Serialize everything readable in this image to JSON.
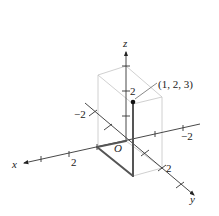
{
  "figure": {
    "type": "3d-coordinate-axes",
    "origin_label": "O",
    "point": {
      "label": "(1, 2, 3)",
      "coords": [
        1,
        2,
        3
      ]
    },
    "axes": {
      "x": {
        "label": "x",
        "positive_tick_label": "2",
        "negative_tick_label": "−2"
      },
      "y": {
        "label": "y",
        "positive_tick_label": "2",
        "negative_tick_label": "−2"
      },
      "z": {
        "label": "z",
        "positive_tick_label": "2"
      }
    },
    "colors": {
      "axis": "#333333",
      "box": "#bdbdbd",
      "path": "#555555",
      "point": "#111111"
    }
  }
}
